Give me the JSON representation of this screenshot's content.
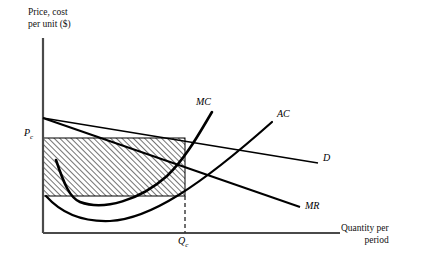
{
  "figure": {
    "type": "economics-diagram"
  },
  "axes": {
    "y_title": "Price, cost per unit ($)",
    "y_title_line1": "Price, cost",
    "y_title_line2": "per unit ($)",
    "x_title": "Quantity per period",
    "x_title_line1": "Quantity per",
    "x_title_line2": "period",
    "origin": {
      "x": 43,
      "y": 233
    },
    "x_axis_end": {
      "x": 340,
      "y": 233
    },
    "y_axis_top": {
      "x": 43,
      "y": 38
    },
    "axis_color": "#4a4a4a"
  },
  "ticks": {
    "price_label": "P",
    "price_subscript": "c",
    "price_y": 138,
    "quantity_label": "Q",
    "quantity_subscript": "c",
    "quantity_x": 185
  },
  "curves": [
    {
      "name": "demand",
      "label": "D",
      "kind": "line",
      "color": "#000000",
      "width": 1.6,
      "points": "43,118 318,163"
    },
    {
      "name": "marginal-revenue",
      "label": "MR",
      "kind": "line",
      "color": "#000000",
      "width": 1.8,
      "points": "43,118 300,207"
    },
    {
      "name": "average-cost",
      "label": "AC",
      "kind": "u-curve",
      "color": "#000000",
      "width": 2.2,
      "path": "M 46,196 C 62,214 84,222 110,221 C 150,219 200,186 272,122",
      "minimum": {
        "x": 108,
        "y": 221
      }
    },
    {
      "name": "marginal-cost",
      "label": "MC",
      "kind": "u-curve",
      "color": "#000000",
      "width": 2.6,
      "path": "M 56,160 C 64,184 70,198 80,202 C 104,211 140,200 167,176 C 186,158 200,132 212,112",
      "minimum": {
        "x": 82,
        "y": 203
      }
    }
  ],
  "shaded_region": {
    "name": "profit-rectangle",
    "left": 43,
    "top": 138,
    "right": 185,
    "bottom": 196,
    "fill": "diagonal-hatch",
    "hatch_color": "#000000",
    "hatch_spacing": 4,
    "border_color": "#000000"
  },
  "dashed_line": {
    "name": "quantity-guide",
    "x": 185,
    "y_start": 196,
    "y_end": 233,
    "color": "#333333",
    "dash": "4 3"
  },
  "colors": {
    "ink": "#000000",
    "axis": "#4a4a4a",
    "background": "#ffffff"
  }
}
